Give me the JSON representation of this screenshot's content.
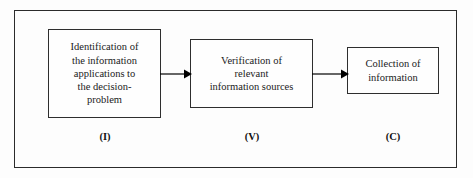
{
  "diagram": {
    "frame": {
      "name": "outer-frame"
    },
    "colors": {
      "background": "#fdfdfd",
      "border": "#2b2b2b",
      "box_border": "#2e2e2e",
      "text": "#1a1a1a",
      "arrow": "#000000"
    },
    "nodes": [
      {
        "id": "identification",
        "text": "Identification of\nthe information\napplications to\nthe decision-\nproblem",
        "caption": "(I)"
      },
      {
        "id": "verification",
        "text": "Verification of\nrelevant\ninformation sources",
        "caption": "(V)"
      },
      {
        "id": "collection",
        "text": "Collection of\ninformation",
        "caption": "(C)"
      }
    ],
    "arrows": [
      {
        "id": "arrow-one",
        "from": "identification",
        "to": "verification"
      },
      {
        "id": "arrow-two",
        "from": "verification",
        "to": "collection"
      }
    ]
  }
}
